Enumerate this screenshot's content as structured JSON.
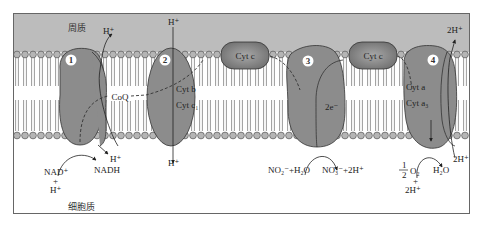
{
  "regions": {
    "periplasm": "周质",
    "cytoplasm": "细胞质"
  },
  "colors": {
    "periplasm_bg": "#bcbcbc",
    "protein_fill": "#8c8c8c",
    "cytc_fill": "#8a8a8a",
    "frame": "#666666",
    "lipid_head": "#b5b5b5",
    "line": "#222222"
  },
  "complexes": [
    {
      "id": "1",
      "number": "1",
      "labels": []
    },
    {
      "id": "2",
      "number": "2",
      "labels": [
        "Cyt b",
        "Cyt c₁"
      ]
    },
    {
      "id": "3",
      "number": "3",
      "labels": [
        "2e⁻"
      ]
    },
    {
      "id": "4",
      "number": "4",
      "labels": [
        "Cyt a",
        "Cyt a₃"
      ]
    }
  ],
  "carriers": {
    "coq": "CoQ",
    "cytc_1": "Cyt c",
    "cytc_2": "Cyt c"
  },
  "top_labels": {
    "h_complex1": "H⁺",
    "h_complex2": "H⁺",
    "h_complex4": "2H⁺"
  },
  "bottom_labels": {
    "nad_plus": "NAD⁺",
    "plus_1": "+",
    "h_plus_1": "H⁺",
    "h_out_1": "H⁺",
    "nadh": "NADH",
    "h_complex2_bottom": "H⁺",
    "no2_h2o": "NO₂⁻+H₂O",
    "no3_2h": "NO₃⁻+2H⁺",
    "half_num": "1",
    "half_den": "2",
    "o2": "O₂",
    "plus_2": "+",
    "two_h_plus": "2H⁺",
    "h2o": "H₂O",
    "two_h_plus_right": "2H⁺"
  }
}
